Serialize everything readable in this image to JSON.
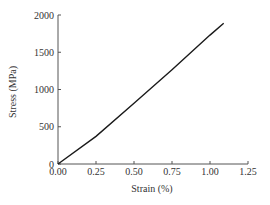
{
  "chart_data": {
    "type": "line",
    "title": "",
    "xlabel": "Strain (%)",
    "ylabel": "Stress (MPa)",
    "xlim": [
      0,
      1.25
    ],
    "ylim": [
      0,
      2000
    ],
    "xticks": [
      "0.00",
      "0.25",
      "0.50",
      "0.75",
      "1.00",
      "1.25"
    ],
    "yticks": [
      "0",
      "500",
      "1000",
      "1500",
      "2000"
    ],
    "grid": false,
    "legend": null,
    "series": [
      {
        "name": "stress-strain",
        "color": "#1a1a1a",
        "x": [
          0.0,
          0.25,
          0.5,
          0.75,
          1.0,
          1.09
        ],
        "y": [
          0,
          370,
          815,
          1265,
          1730,
          1890
        ]
      }
    ]
  }
}
